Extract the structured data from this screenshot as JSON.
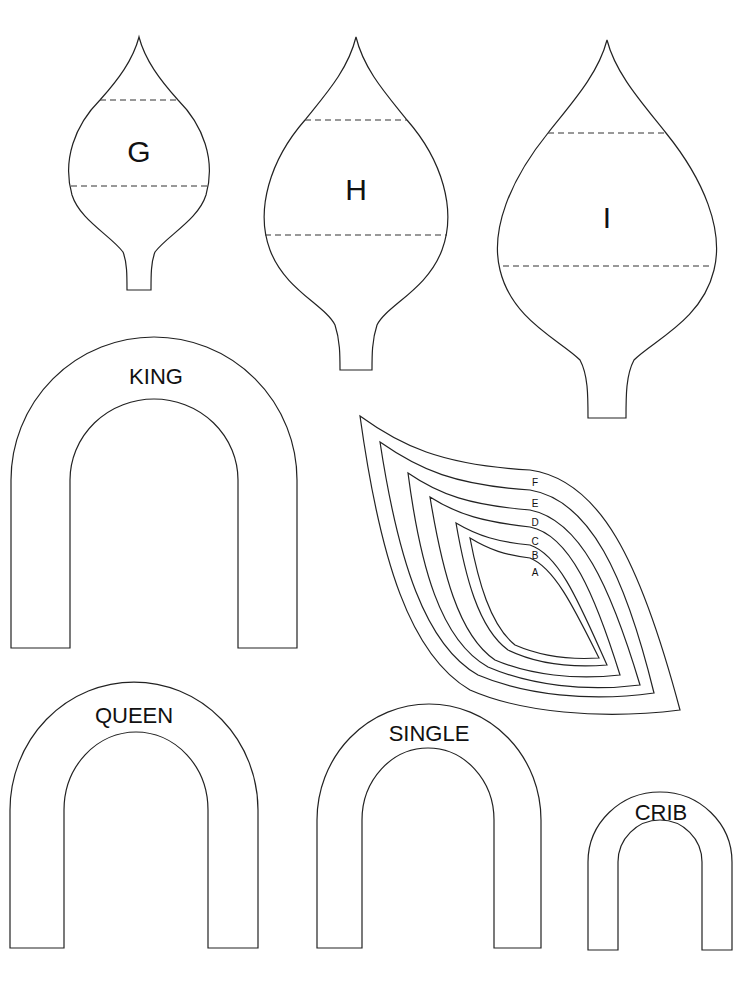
{
  "petals": [
    {
      "id": "G",
      "label": "G",
      "fold_lines": 2
    },
    {
      "id": "H",
      "label": "H",
      "fold_lines": 2
    },
    {
      "id": "I",
      "label": "I",
      "fold_lines": 2
    }
  ],
  "leaf_template": {
    "sizes": [
      "F",
      "E",
      "D",
      "C",
      "B",
      "A"
    ]
  },
  "arches": [
    {
      "id": "king",
      "label": "KING"
    },
    {
      "id": "queen",
      "label": "QUEEN"
    },
    {
      "id": "single",
      "label": "SINGLE"
    },
    {
      "id": "crib",
      "label": "CRIB"
    }
  ]
}
